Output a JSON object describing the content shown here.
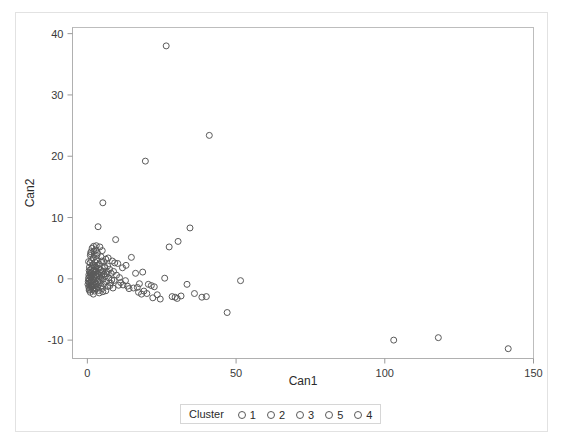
{
  "chart_data": {
    "type": "scatter",
    "title": "",
    "xlabel": "Can1",
    "ylabel": "Can2",
    "xlim": [
      -5,
      150
    ],
    "ylim": [
      -13,
      41
    ],
    "xticks": [
      0,
      50,
      100,
      150
    ],
    "yticks": [
      -10,
      0,
      10,
      20,
      30,
      40
    ],
    "grid": false,
    "legend": {
      "title": "Cluster",
      "position": "bottom-center",
      "entries": [
        {
          "label": "1",
          "marker": "open-circle",
          "color": "#5a5a5a"
        },
        {
          "label": "2",
          "marker": "open-circle",
          "color": "#5a5a5a"
        },
        {
          "label": "3",
          "marker": "open-circle",
          "color": "#5a5a5a"
        },
        {
          "label": "5",
          "marker": "open-circle",
          "color": "#5a5a5a"
        },
        {
          "label": "4",
          "marker": "open-circle",
          "color": "#5a5a5a"
        }
      ]
    },
    "marker_style": {
      "shape": "open-circle",
      "radius_px": 3,
      "stroke": "#5a5a5a"
    },
    "series": [
      {
        "name": "Cluster",
        "points": [
          [
            26.5,
            38.0
          ],
          [
            41.0,
            23.4
          ],
          [
            19.5,
            19.2
          ],
          [
            5.2,
            12.4
          ],
          [
            3.6,
            8.5
          ],
          [
            34.5,
            8.3
          ],
          [
            9.5,
            6.4
          ],
          [
            30.5,
            6.1
          ],
          [
            27.5,
            5.2
          ],
          [
            3.0,
            5.4
          ],
          [
            2.1,
            5.3
          ],
          [
            4.2,
            5.2
          ],
          [
            1.6,
            5.0
          ],
          [
            2.8,
            4.7
          ],
          [
            5.0,
            4.6
          ],
          [
            1.2,
            4.4
          ],
          [
            3.4,
            4.2
          ],
          [
            2.3,
            4.0
          ],
          [
            14.8,
            3.5
          ],
          [
            1.0,
            3.8
          ],
          [
            4.6,
            3.6
          ],
          [
            2.0,
            3.4
          ],
          [
            6.2,
            3.2
          ],
          [
            3.1,
            3.1
          ],
          [
            1.4,
            3.0
          ],
          [
            8.4,
            2.9
          ],
          [
            5.4,
            2.8
          ],
          [
            2.6,
            2.7
          ],
          [
            0.9,
            2.6
          ],
          [
            10.2,
            2.5
          ],
          [
            4.0,
            2.4
          ],
          [
            1.8,
            2.3
          ],
          [
            3.3,
            2.2
          ],
          [
            6.8,
            2.1
          ],
          [
            2.4,
            2.0
          ],
          [
            0.7,
            1.9
          ],
          [
            5.8,
            1.8
          ],
          [
            1.5,
            1.75
          ],
          [
            3.8,
            1.7
          ],
          [
            2.9,
            1.6
          ],
          [
            7.5,
            1.55
          ],
          [
            1.1,
            1.5
          ],
          [
            4.4,
            1.45
          ],
          [
            2.2,
            1.4
          ],
          [
            18.6,
            1.1
          ],
          [
            16.2,
            0.9
          ],
          [
            0.6,
            1.35
          ],
          [
            3.0,
            1.3
          ],
          [
            5.2,
            1.25
          ],
          [
            1.9,
            1.2
          ],
          [
            6.5,
            1.15
          ],
          [
            2.6,
            1.1
          ],
          [
            0.9,
            1.05
          ],
          [
            4.1,
            1.0
          ],
          [
            1.3,
            0.95
          ],
          [
            8.0,
            0.9
          ],
          [
            3.5,
            0.85
          ],
          [
            2.0,
            0.8
          ],
          [
            5.6,
            0.75
          ],
          [
            1.0,
            0.7
          ],
          [
            0.5,
            0.65
          ],
          [
            2.8,
            0.6
          ],
          [
            4.8,
            0.55
          ],
          [
            1.6,
            0.5
          ],
          [
            3.2,
            0.45
          ],
          [
            6.0,
            0.4
          ],
          [
            0.8,
            0.35
          ],
          [
            2.3,
            0.3
          ],
          [
            1.2,
            0.25
          ],
          [
            4.5,
            0.2
          ],
          [
            7.2,
            0.15
          ],
          [
            0.4,
            0.1
          ],
          [
            2.7,
            0.05
          ],
          [
            1.7,
            0.0
          ],
          [
            3.9,
            -0.05
          ],
          [
            5.1,
            -0.1
          ],
          [
            0.7,
            -0.15
          ],
          [
            2.1,
            -0.2
          ],
          [
            9.0,
            -0.25
          ],
          [
            1.4,
            -0.3
          ],
          [
            3.6,
            -0.35
          ],
          [
            0.3,
            -0.4
          ],
          [
            6.4,
            -0.45
          ],
          [
            2.5,
            -0.5
          ],
          [
            1.0,
            -0.55
          ],
          [
            4.2,
            -0.6
          ],
          [
            0.6,
            -0.65
          ],
          [
            7.8,
            -0.7
          ],
          [
            2.9,
            -0.75
          ],
          [
            1.8,
            -0.8
          ],
          [
            5.5,
            -0.85
          ],
          [
            0.2,
            -0.9
          ],
          [
            3.1,
            -0.95
          ],
          [
            1.3,
            -1.0
          ],
          [
            10.5,
            -1.05
          ],
          [
            2.2,
            -1.1
          ],
          [
            0.9,
            -1.15
          ],
          [
            4.6,
            -1.2
          ],
          [
            6.9,
            -1.25
          ],
          [
            1.6,
            -1.3
          ],
          [
            3.4,
            -1.35
          ],
          [
            0.5,
            -1.4
          ],
          [
            2.6,
            -1.45
          ],
          [
            8.6,
            -1.5
          ],
          [
            1.1,
            -1.55
          ],
          [
            5.0,
            -1.6
          ],
          [
            3.0,
            -1.65
          ],
          [
            0.7,
            -1.7
          ],
          [
            12.0,
            -1.0
          ],
          [
            13.5,
            -1.2
          ],
          [
            11.2,
            -0.6
          ],
          [
            14.0,
            -1.6
          ],
          [
            15.5,
            -1.5
          ],
          [
            16.8,
            -1.4
          ],
          [
            17.5,
            -0.8
          ],
          [
            12.8,
            -0.3
          ],
          [
            10.8,
            0.2
          ],
          [
            9.8,
            0.6
          ],
          [
            8.8,
            1.2
          ],
          [
            11.8,
            1.8
          ],
          [
            13.0,
            2.2
          ],
          [
            9.2,
            2.6
          ],
          [
            7.0,
            3.4
          ],
          [
            20.5,
            -0.9
          ],
          [
            21.5,
            -1.1
          ],
          [
            22.5,
            -1.3
          ],
          [
            19.0,
            -2.0
          ],
          [
            20.0,
            -2.4
          ],
          [
            23.5,
            -2.6
          ],
          [
            24.5,
            -3.3
          ],
          [
            22.0,
            -3.1
          ],
          [
            17.2,
            -2.2
          ],
          [
            18.2,
            -2.5
          ],
          [
            26.0,
            0.1
          ],
          [
            28.5,
            -2.9
          ],
          [
            29.5,
            -3.0
          ],
          [
            30.2,
            -3.2
          ],
          [
            31.5,
            -2.8
          ],
          [
            33.5,
            -0.9
          ],
          [
            36.0,
            -2.4
          ],
          [
            38.5,
            -3.0
          ],
          [
            51.5,
            -0.3
          ],
          [
            47.0,
            -5.5
          ],
          [
            40.0,
            -2.9
          ],
          [
            103.0,
            -10.0
          ],
          [
            118.0,
            -9.6
          ],
          [
            141.5,
            -11.4
          ],
          [
            2.4,
            -2.0
          ],
          [
            1.0,
            -2.2
          ],
          [
            3.8,
            -1.9
          ],
          [
            5.2,
            -2.1
          ],
          [
            0.6,
            -1.85
          ],
          [
            4.0,
            -2.3
          ],
          [
            2.0,
            -2.5
          ],
          [
            6.2,
            -1.95
          ],
          [
            1.5,
            -0.45
          ],
          [
            2.9,
            1.9
          ],
          [
            0.4,
            2.8
          ],
          [
            1.9,
            -1.75
          ],
          [
            7.6,
            -1.1
          ],
          [
            8.2,
            -0.2
          ],
          [
            6.6,
            0.8
          ],
          [
            5.8,
            2.0
          ],
          [
            4.8,
            2.9
          ],
          [
            3.2,
            3.8
          ],
          [
            2.2,
            4.5
          ],
          [
            1.1,
            4.1
          ]
        ]
      }
    ]
  },
  "axes": {
    "x_title": "Can1",
    "y_title": "Can2",
    "x_tick_labels": [
      "0",
      "50",
      "100",
      "150"
    ],
    "y_tick_labels": [
      "40",
      "30",
      "20",
      "10",
      "0",
      "-10"
    ]
  },
  "legend": {
    "title": "Cluster",
    "items": [
      {
        "label": "1"
      },
      {
        "label": "2"
      },
      {
        "label": "3"
      },
      {
        "label": "5"
      },
      {
        "label": "4"
      }
    ]
  },
  "colors": {
    "marker_stroke": "#5a5a5a",
    "axis": "#b0b0b0",
    "frame": "#bdbdbd",
    "text": "#2b2b2b",
    "background": "#ffffff"
  }
}
